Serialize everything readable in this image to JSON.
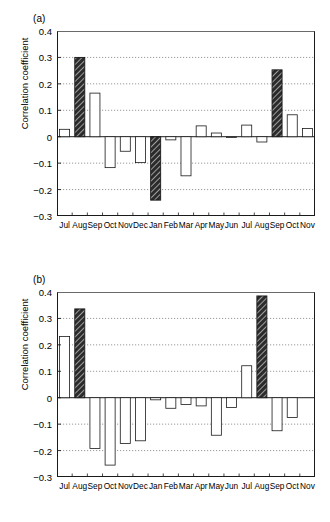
{
  "figure": {
    "width": 330,
    "height": 522,
    "background": "#ffffff",
    "line_color": "#1a1a1a",
    "bar_fill_open": "#ffffff",
    "bar_fill_hatched": "#2b2b2b",
    "grid_color": "#808080"
  },
  "panels": [
    {
      "tag": "(a)",
      "chart_ref": 0
    },
    {
      "tag": "(b)",
      "chart_ref": 1
    }
  ],
  "chart_data": [
    {
      "type": "bar",
      "panel": "(a)",
      "title": "",
      "xlabel": "",
      "ylabel": "Correlation coefficient",
      "ylim": [
        -0.3,
        0.4
      ],
      "yticks": [
        -0.3,
        -0.2,
        -0.1,
        0,
        0.1,
        0.2,
        0.3,
        0.4
      ],
      "ytick_labels": [
        "−0.3",
        "−0.2",
        "−0.1",
        "0",
        "0.1",
        "0.2",
        "0.3",
        "0.4"
      ],
      "grid": true,
      "grid_axis": "y",
      "legend": "none",
      "categories": [
        "Jul",
        "Aug",
        "Sep",
        "Oct",
        "Nov",
        "Dec",
        "Jan",
        "Feb",
        "Mar",
        "Apr",
        "May",
        "Jun",
        "Jul",
        "Aug",
        "Sep",
        "Oct",
        "Nov"
      ],
      "values": [
        0.028,
        0.3,
        0.165,
        -0.117,
        -0.055,
        -0.098,
        -0.24,
        -0.012,
        -0.148,
        0.041,
        0.014,
        -0.003,
        0.044,
        -0.02,
        0.253,
        0.083,
        0.031
      ],
      "styles": [
        "open",
        "hatched",
        "open",
        "open",
        "open",
        "open",
        "hatched",
        "open",
        "open",
        "open",
        "open",
        "open",
        "open",
        "open",
        "hatched",
        "open",
        "open"
      ]
    },
    {
      "type": "bar",
      "panel": "(b)",
      "title": "",
      "xlabel": "",
      "ylabel": "Correlation coefficient",
      "ylim": [
        -0.3,
        0.4
      ],
      "yticks": [
        -0.3,
        -0.2,
        -0.1,
        0,
        0.1,
        0.2,
        0.3,
        0.4
      ],
      "ytick_labels": [
        "−0.3",
        "−0.2",
        "−0.1",
        "0",
        "0.1",
        "0.2",
        "0.3",
        "0.4"
      ],
      "grid": true,
      "grid_axis": "y",
      "legend": "none",
      "categories": [
        "Jul",
        "Aug",
        "Sep",
        "Oct",
        "Nov",
        "Dec",
        "Jan",
        "Feb",
        "Mar",
        "Apr",
        "May",
        "Jun",
        "Jul",
        "Aug",
        "Sep",
        "Oct",
        "Nov"
      ],
      "values": [
        0.232,
        0.336,
        -0.192,
        -0.255,
        -0.173,
        -0.163,
        -0.008,
        -0.04,
        -0.026,
        -0.031,
        -0.142,
        -0.037,
        0.121,
        0.385,
        -0.125,
        -0.075,
        0.0
      ],
      "styles": [
        "open",
        "hatched",
        "open",
        "open",
        "open",
        "open",
        "open",
        "open",
        "open",
        "open",
        "open",
        "open",
        "open",
        "hatched",
        "open",
        "open",
        "open"
      ]
    }
  ]
}
